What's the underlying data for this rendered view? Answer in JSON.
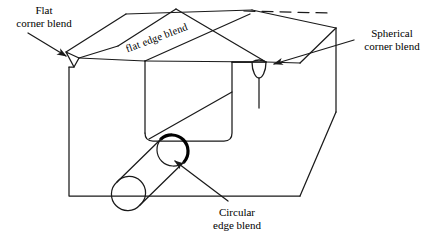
{
  "figure": {
    "kind": "engineering-blend-diagram",
    "background_color": "#ffffff",
    "line_color": "#1a1a1a",
    "bold_line_color": "#000000"
  },
  "labels": {
    "flat_corner_blend": {
      "line1": "Flat",
      "line2": "corner blend"
    },
    "spherical_corner_blend": {
      "line1": "Spherical",
      "line2": "corner blend"
    },
    "circular_edge_blend": {
      "line1": "Circular",
      "line2": "edge blend"
    },
    "flat_edge_blend": {
      "text": "flat edge blend"
    }
  },
  "geometry": {
    "block": {
      "front_face": "M 69,60 L 69,196 L 300,196 L 300,62",
      "top_front_edge_left": "M 69,60 L 300,62",
      "right_face": "M 300,62 L 336,28 L 336,112 L 300,196",
      "top_rear_edge": "M 336,28 L 252,10",
      "top_left_edge": "M 69,60 L 126,14",
      "top_face_rear": "M 126,14 L 252,10"
    },
    "chamfer_strip": {
      "quad": "M 104,56 L 161,10 L 268,44 L 214,70 Z",
      "rotation_deg": -20.5
    },
    "slot": {
      "outline": "M 145,66 L 145,140 L 232,140 L 232,60",
      "diagonal": "M 145,140 L 232,92",
      "corner_radius": 7
    },
    "flat_corner_blend_facet": {
      "path": "M 66,52 L 79,58 L 74,67 Z"
    },
    "spherical_corner_blend_facet": {
      "center_x": 259,
      "center_y": 62,
      "radius": 8
    },
    "cylinder": {
      "axis_start_x": 126,
      "axis_start_y": 210,
      "axis_end_x": 175,
      "axis_end_y": 160,
      "radius": 16,
      "bold_cap_arc": true
    },
    "dashed_top_edge": {
      "path": "M 252,10 L 336,12",
      "dash": "10 6"
    },
    "leaders": [
      {
        "name": "flat-corner",
        "from_x": 30,
        "from_y": 34,
        "to_x": 69,
        "to_y": 58,
        "arrow": true
      },
      {
        "name": "spherical-corner",
        "from_x": 352,
        "from_y": 40,
        "to_x": 272,
        "to_y": 63,
        "arrow": true
      },
      {
        "name": "circular-edge",
        "from_x": 226,
        "from_y": 200,
        "to_x": 172,
        "to_y": 162,
        "arrow": true
      }
    ]
  }
}
